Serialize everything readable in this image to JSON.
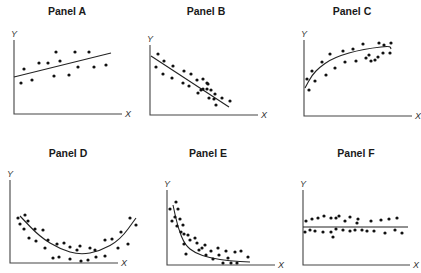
{
  "chart_data": [
    {
      "type": "scatter",
      "title": "Panel A",
      "xlabel": "X",
      "ylabel": "Y",
      "relationship": "weak positive linear",
      "fit": "linear",
      "grid": false,
      "origin": [
        14,
        114
      ],
      "axis_end": [
        122,
        40
      ],
      "title_pos": [
        67,
        15
      ],
      "fit_points": [
        [
          14,
          77
        ],
        [
          111,
          53
        ]
      ],
      "points": [
        [
          21,
          83
        ],
        [
          24,
          69
        ],
        [
          32,
          80
        ],
        [
          39,
          63
        ],
        [
          48,
          63
        ],
        [
          56,
          52
        ],
        [
          54,
          76
        ],
        [
          60,
          61
        ],
        [
          69,
          75
        ],
        [
          75,
          52
        ],
        [
          78,
          67
        ],
        [
          89,
          52
        ],
        [
          94,
          67
        ],
        [
          106,
          65
        ]
      ]
    },
    {
      "type": "scatter",
      "title": "Panel B",
      "xlabel": "X",
      "ylabel": "Y",
      "relationship": "strong negative linear",
      "fit": "linear",
      "grid": false,
      "origin": [
        150,
        115
      ],
      "axis_end": [
        258,
        45
      ],
      "title_pos": [
        206,
        15
      ],
      "fit_points": [
        [
          151,
          56
        ],
        [
          229,
          107
        ]
      ],
      "points": [
        [
          158,
          54
        ],
        [
          164,
          61
        ],
        [
          156,
          67
        ],
        [
          163,
          74
        ],
        [
          173,
          66
        ],
        [
          172,
          78
        ],
        [
          184,
          71
        ],
        [
          183,
          83
        ],
        [
          191,
          74
        ],
        [
          189,
          86
        ],
        [
          198,
          93
        ],
        [
          197,
          80
        ],
        [
          201,
          90
        ],
        [
          203,
          79
        ],
        [
          207,
          83
        ],
        [
          203,
          89
        ],
        [
          209,
          98
        ],
        [
          207,
          89
        ],
        [
          208,
          84
        ],
        [
          215,
          94
        ],
        [
          214,
          99
        ],
        [
          211,
          90
        ],
        [
          216,
          105
        ],
        [
          222,
          98
        ],
        [
          230,
          101
        ]
      ]
    },
    {
      "type": "scatter",
      "title": "Panel C",
      "xlabel": "X",
      "ylabel": "Y",
      "relationship": "positive logarithmic / saturating",
      "fit": "log",
      "grid": false,
      "origin": [
        304,
        116
      ],
      "axis_end": [
        412,
        40
      ],
      "title_pos": [
        352,
        15
      ],
      "fit_points": [
        [
          305,
          88
        ],
        [
          312,
          75
        ],
        [
          320,
          67
        ],
        [
          330,
          60
        ],
        [
          342,
          55
        ],
        [
          356,
          51
        ],
        [
          372,
          48
        ],
        [
          390,
          46
        ],
        [
          391,
          49
        ]
      ],
      "points": [
        [
          307,
          79
        ],
        [
          309,
          90
        ],
        [
          312,
          71
        ],
        [
          315,
          81
        ],
        [
          322,
          62
        ],
        [
          326,
          75
        ],
        [
          330,
          54
        ],
        [
          335,
          68
        ],
        [
          343,
          51
        ],
        [
          345,
          62
        ],
        [
          353,
          49
        ],
        [
          356,
          61
        ],
        [
          363,
          44
        ],
        [
          366,
          58
        ],
        [
          369,
          55
        ],
        [
          371,
          61
        ],
        [
          375,
          60
        ],
        [
          378,
          57
        ],
        [
          379,
          43
        ],
        [
          383,
          53
        ],
        [
          384,
          45
        ],
        [
          390,
          53
        ],
        [
          391,
          43
        ]
      ]
    },
    {
      "type": "scatter",
      "title": "Panel D",
      "xlabel": "X",
      "ylabel": "Y",
      "relationship": "U-shaped / quadratic",
      "fit": "quadratic",
      "grid": false,
      "origin": [
        10,
        263
      ],
      "axis_end": [
        118,
        180
      ],
      "title_pos": [
        68,
        157
      ],
      "fit_points": [
        [
          20,
          216
        ],
        [
          40,
          237
        ],
        [
          60,
          249
        ],
        [
          80,
          255
        ],
        [
          100,
          251
        ],
        [
          120,
          240
        ],
        [
          136,
          218
        ]
      ],
      "points": [
        [
          18,
          218
        ],
        [
          20,
          224
        ],
        [
          25,
          215
        ],
        [
          24,
          229
        ],
        [
          28,
          221
        ],
        [
          29,
          238
        ],
        [
          35,
          229
        ],
        [
          36,
          241
        ],
        [
          43,
          230
        ],
        [
          45,
          248
        ],
        [
          48,
          240
        ],
        [
          53,
          258
        ],
        [
          57,
          244
        ],
        [
          59,
          257
        ],
        [
          64,
          243
        ],
        [
          70,
          247
        ],
        [
          70,
          259
        ],
        [
          77,
          250
        ],
        [
          80,
          246
        ],
        [
          81,
          261
        ],
        [
          90,
          248
        ],
        [
          88,
          260
        ],
        [
          95,
          250
        ],
        [
          96,
          257
        ],
        [
          105,
          240
        ],
        [
          105,
          256
        ],
        [
          112,
          239
        ],
        [
          118,
          248
        ],
        [
          121,
          232
        ],
        [
          128,
          244
        ],
        [
          130,
          218
        ],
        [
          136,
          225
        ]
      ]
    },
    {
      "type": "scatter",
      "title": "Panel E",
      "xlabel": "X",
      "ylabel": "Y",
      "relationship": "negative exponential / decay",
      "fit": "exponential decay",
      "grid": false,
      "origin": [
        167,
        265
      ],
      "axis_end": [
        275,
        190
      ],
      "title_pos": [
        208,
        157
      ],
      "fit_points": [
        [
          173,
          205
        ],
        [
          178,
          228
        ],
        [
          185,
          245
        ],
        [
          195,
          253
        ],
        [
          210,
          258
        ],
        [
          230,
          261
        ],
        [
          250,
          262
        ]
      ],
      "points": [
        [
          170,
          209
        ],
        [
          172,
          221
        ],
        [
          175,
          217
        ],
        [
          176,
          202
        ],
        [
          177,
          226
        ],
        [
          178,
          209
        ],
        [
          180,
          219
        ],
        [
          181,
          232
        ],
        [
          183,
          225
        ],
        [
          184,
          234
        ],
        [
          184,
          244
        ],
        [
          186,
          254
        ],
        [
          188,
          235
        ],
        [
          190,
          240
        ],
        [
          195,
          238
        ],
        [
          197,
          243
        ],
        [
          199,
          250
        ],
        [
          202,
          248
        ],
        [
          205,
          245
        ],
        [
          206,
          255
        ],
        [
          211,
          251
        ],
        [
          213,
          259
        ],
        [
          218,
          248
        ],
        [
          219,
          255
        ],
        [
          223,
          263
        ],
        [
          226,
          251
        ],
        [
          228,
          258
        ],
        [
          231,
          263
        ],
        [
          235,
          252
        ],
        [
          237,
          263
        ],
        [
          241,
          251
        ],
        [
          248,
          257
        ]
      ]
    },
    {
      "type": "scatter",
      "title": "Panel F",
      "xlabel": "X",
      "ylabel": "Y",
      "relationship": "no correlation (horizontal)",
      "fit": "constant",
      "grid": false,
      "origin": [
        303,
        265
      ],
      "axis_end": [
        410,
        190
      ],
      "title_pos": [
        356,
        157
      ],
      "fit_points": [
        [
          303,
          227
        ],
        [
          408,
          227
        ]
      ],
      "points": [
        [
          305,
          232
        ],
        [
          306,
          221
        ],
        [
          310,
          230
        ],
        [
          312,
          219
        ],
        [
          315,
          231
        ],
        [
          318,
          218
        ],
        [
          323,
          232
        ],
        [
          324,
          216
        ],
        [
          331,
          218
        ],
        [
          331,
          232
        ],
        [
          333,
          237
        ],
        [
          336,
          218
        ],
        [
          336,
          229
        ],
        [
          339,
          216
        ],
        [
          343,
          230
        ],
        [
          345,
          221
        ],
        [
          350,
          217
        ],
        [
          350,
          231
        ],
        [
          355,
          230
        ],
        [
          357,
          223
        ],
        [
          358,
          219
        ],
        [
          362,
          230
        ],
        [
          367,
          231
        ],
        [
          371,
          221
        ],
        [
          374,
          231
        ],
        [
          381,
          220
        ],
        [
          385,
          233
        ],
        [
          389,
          219
        ],
        [
          395,
          230
        ],
        [
          397,
          218
        ],
        [
          402,
          233
        ]
      ]
    }
  ]
}
